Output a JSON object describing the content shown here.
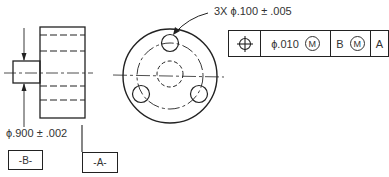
{
  "drawing": {
    "hole_callout": "3X ϕ.100 ± .005",
    "boss_dimension": "ϕ.900 ± .002",
    "feature_control_frame": {
      "symbol": "position-icon",
      "tolerance": "ϕ.010",
      "tolerance_modifier": "M",
      "datum_primary_label": "B",
      "datum_primary_modifier": "M",
      "datum_secondary_label": "A"
    },
    "datums": {
      "b": "-B-",
      "a": "-A-"
    }
  }
}
